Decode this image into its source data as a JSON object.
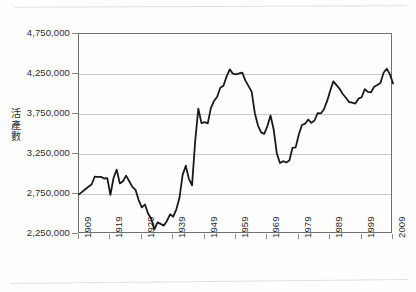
{
  "figure": {
    "name": "live-births-line-chart",
    "background": "#ffffff",
    "line_color": "#1a1a1a",
    "grid_color": "#c9c9c9",
    "axis_color": "#6f6f6f"
  },
  "chart_data": {
    "type": "line",
    "title": "",
    "xlabel": "",
    "ylabel": "活產數",
    "xlim": [
      1909,
      2009
    ],
    "ylim": [
      2250000,
      4750000
    ],
    "grid": true,
    "legend": null,
    "y_ticks": [
      "4,750,000",
      "4,250,000",
      "3,750,000",
      "3,250,000",
      "2,750,000",
      "2,250,000"
    ],
    "y_tick_values": [
      4750000,
      4250000,
      3750000,
      3250000,
      2750000,
      2250000
    ],
    "x_ticks": [
      "1909",
      "1919",
      "1929",
      "1939",
      "1949",
      "1959",
      "1969",
      "1979",
      "1989",
      "1999",
      "2009"
    ],
    "x_tick_values": [
      1909,
      1919,
      1929,
      1939,
      1949,
      1959,
      1969,
      1979,
      1989,
      1999,
      2009
    ],
    "series": [
      {
        "name": "活產數",
        "color": "#1a1a1a",
        "x": [
          1909,
          1910,
          1911,
          1912,
          1913,
          1914,
          1915,
          1916,
          1917,
          1918,
          1919,
          1920,
          1921,
          1922,
          1923,
          1924,
          1925,
          1926,
          1927,
          1928,
          1929,
          1930,
          1931,
          1932,
          1933,
          1934,
          1935,
          1936,
          1937,
          1938,
          1939,
          1940,
          1941,
          1942,
          1943,
          1944,
          1945,
          1946,
          1947,
          1948,
          1949,
          1950,
          1951,
          1952,
          1953,
          1954,
          1955,
          1956,
          1957,
          1958,
          1959,
          1960,
          1961,
          1962,
          1963,
          1964,
          1965,
          1966,
          1967,
          1968,
          1969,
          1970,
          1971,
          1972,
          1973,
          1974,
          1975,
          1976,
          1977,
          1978,
          1979,
          1980,
          1981,
          1982,
          1983,
          1984,
          1985,
          1986,
          1987,
          1988,
          1989,
          1990,
          1991,
          1992,
          1993,
          1994,
          1995,
          1996,
          1997,
          1998,
          1999,
          2000,
          2001,
          2002,
          2003,
          2004,
          2005,
          2006,
          2007,
          2008,
          2009
        ],
        "values": [
          2745000,
          2777000,
          2809000,
          2840000,
          2869000,
          2966000,
          2965000,
          2964000,
          2944000,
          2948000,
          2740000,
          2950000,
          3055000,
          2882000,
          2910000,
          2979000,
          2909000,
          2839000,
          2802000,
          2674000,
          2582000,
          2618000,
          2506000,
          2440000,
          2307000,
          2396000,
          2377000,
          2355000,
          2413000,
          2496000,
          2466000,
          2559000,
          2703000,
          2989000,
          3104000,
          2939000,
          2858000,
          3411000,
          3817000,
          3637000,
          3649000,
          3632000,
          3823000,
          3913000,
          3965000,
          4078000,
          4104000,
          4218000,
          4308000,
          4255000,
          4245000,
          4258000,
          4268000,
          4167000,
          4098000,
          4027000,
          3760000,
          3606000,
          3521000,
          3502000,
          3600000,
          3731000,
          3556000,
          3258000,
          3137000,
          3160000,
          3144000,
          3168000,
          3327000,
          3333000,
          3494000,
          3612000,
          3629000,
          3681000,
          3639000,
          3669000,
          3761000,
          3757000,
          3809000,
          3910000,
          4041000,
          4158000,
          4111000,
          4065000,
          4000000,
          3953000,
          3900000,
          3891000,
          3881000,
          3942000,
          3959000,
          4059000,
          4026000,
          4022000,
          4090000,
          4112000,
          4138000,
          4266000,
          4316000,
          4248000,
          4131000
        ]
      }
    ]
  }
}
